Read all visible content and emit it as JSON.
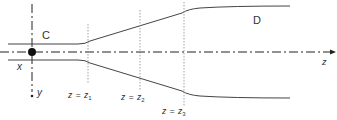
{
  "diagram": {
    "type": "nozzle-geometry",
    "labels": {
      "upstream_region": "C",
      "downstream_region": "D",
      "x_axis": "x",
      "y_axis": "y",
      "z_axis": "z"
    },
    "stations": [
      {
        "var": "z",
        "eq": "=",
        "sym": "z",
        "sub": "1"
      },
      {
        "var": "z",
        "eq": "=",
        "sym": "z",
        "sub": "2"
      },
      {
        "var": "z",
        "eq": "=",
        "sym": "z",
        "sub": "3"
      }
    ],
    "colors": {
      "line": "#444444",
      "axis": "#222222",
      "guide": "#888888",
      "text": "#333333"
    }
  }
}
